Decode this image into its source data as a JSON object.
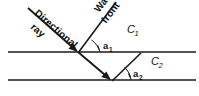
{
  "figure": {
    "background_color": "#ffffff",
    "ink_color": "#1a1a1a",
    "labels": {
      "directional_ray": "Directional",
      "directional_ray_second": "ray",
      "wave": "Wave",
      "front": "front",
      "speed_upper": "C",
      "speed_upper_sub": "1",
      "speed_lower": "C",
      "speed_lower_sub": "2",
      "angle_upper": "a",
      "angle_upper_sub": "1",
      "angle_lower": "a",
      "angle_lower_sub": "2"
    },
    "geometry": {
      "boundary_upper_y": 52,
      "boundary_lower_y": 80,
      "boundary_x_start": 8,
      "boundary_x_end": 196,
      "incident_ray_start": [
        28,
        8
      ],
      "incident_ray_end": [
        78,
        52
      ],
      "refracted_ray_start": [
        78,
        52
      ],
      "refracted_ray_end": [
        111,
        80
      ],
      "wavefront_upper_start": [
        116,
        2
      ],
      "wavefront_upper_end": [
        80,
        50
      ],
      "wavefront_lower_start": [
        141,
        53
      ],
      "wavefront_lower_end": [
        114,
        79
      ],
      "label_c1_pos": [
        128,
        32
      ],
      "label_c2_pos": [
        152,
        64
      ],
      "label_a1_pos": [
        98,
        46
      ],
      "label_a2_pos": [
        129,
        75
      ],
      "directional_ray_angle_deg": 41,
      "wavefront_angle_deg": 53
    }
  }
}
